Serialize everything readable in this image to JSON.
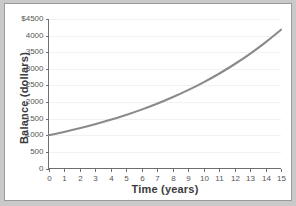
{
  "chart_data": {
    "type": "line",
    "title": "",
    "xlabel": "Time (years)",
    "ylabel": "Balance (dollars)",
    "xlim": [
      0,
      15
    ],
    "ylim": [
      0,
      4500
    ],
    "grid": true,
    "legend": null,
    "line_color": "#8a8a8a",
    "xticks": [
      "0",
      "1",
      "2",
      "3",
      "4",
      "5",
      "6",
      "7",
      "8",
      "9",
      "10",
      "11",
      "12",
      "13",
      "14",
      "15"
    ],
    "xtick_values": [
      0,
      1,
      2,
      3,
      4,
      5,
      6,
      7,
      8,
      9,
      10,
      11,
      12,
      13,
      14,
      15
    ],
    "yticks": [
      "0",
      "500",
      "1000",
      "1500",
      "2000",
      "2500",
      "3000",
      "3500",
      "4000",
      "$4500"
    ],
    "ytick_values": [
      0,
      500,
      1000,
      1500,
      2000,
      2500,
      3000,
      3500,
      4000,
      4500
    ],
    "series": [
      {
        "name": "Balance",
        "x": [
          0,
          1,
          2,
          3,
          4,
          5,
          6,
          7,
          8,
          9,
          10,
          11,
          12,
          13,
          14,
          15
        ],
        "values": [
          1000,
          1100,
          1210,
          1331,
          1464,
          1611,
          1772,
          1949,
          2144,
          2358,
          2594,
          2853,
          3138,
          3452,
          3797,
          4177
        ]
      }
    ]
  },
  "page": {
    "background_color": "#c9c9c9",
    "plot_background_color": "#ffffff",
    "border_color": "#9a9a9a",
    "axis_color": "#6f6f6f",
    "gridline_color": "#f0f0f0",
    "tick_text_color": "#555555",
    "axis_title_color": "#3b3b3b"
  }
}
